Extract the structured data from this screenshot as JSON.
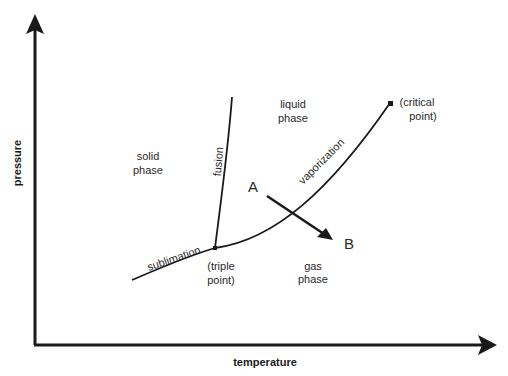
{
  "diagram": {
    "type": "phase-diagram",
    "axes": {
      "x_label": "temperature",
      "y_label": "pressure"
    },
    "regions": [
      {
        "id": "solid",
        "lines": [
          "solid",
          "phase"
        ]
      },
      {
        "id": "liquid",
        "lines": [
          "liquid",
          "phase"
        ]
      },
      {
        "id": "gas",
        "lines": [
          "gas",
          "phase"
        ]
      }
    ],
    "curves": [
      {
        "id": "fusion",
        "label": "fusion"
      },
      {
        "id": "sublimation",
        "label": "sublimation"
      },
      {
        "id": "vaporization",
        "label": "vaporization"
      }
    ],
    "points": {
      "triple": {
        "lines": [
          "(triple",
          "point)"
        ]
      },
      "critical": {
        "lines": [
          "(critical",
          "point)"
        ]
      }
    },
    "process": {
      "start_label": "A",
      "end_label": "B"
    },
    "colors": {
      "line": "#1a1a1a",
      "text": "#2a2a2a",
      "background": "#ffffff"
    }
  }
}
